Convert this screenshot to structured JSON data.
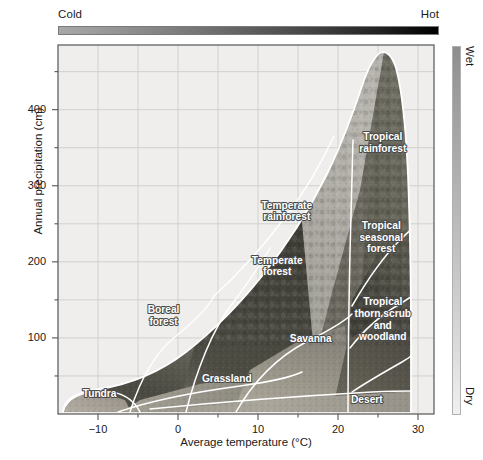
{
  "figure": {
    "axes": {
      "x_title": "Average temperature (°C)",
      "y_title": "Annual precipitation (cm)"
    },
    "gradients": {
      "temperature": {
        "left_label": "Cold",
        "right_label": "Hot",
        "left_color": "#a8a8a8",
        "right_color": "#000000"
      },
      "precipitation": {
        "top_label": "Wet",
        "bottom_label": "Dry",
        "top_color": "#8d8d8d",
        "bottom_color": "#f0f0f0"
      }
    }
  },
  "chart_data": {
    "type": "scatter",
    "title": "",
    "xlabel": "Average temperature (°C)",
    "ylabel": "Annual precipitation (cm)",
    "xlim": [
      -15,
      32
    ],
    "ylim": [
      0,
      485
    ],
    "xticks_major": [
      -10,
      0,
      10,
      20,
      30
    ],
    "xticks_major_labels": [
      "−10",
      "0",
      "10",
      "20",
      "30"
    ],
    "xticks_minor": [
      -5,
      5,
      15,
      25
    ],
    "yticks_major": [
      100,
      200,
      300,
      400
    ],
    "yticks_major_labels": [
      "100",
      "200",
      "300",
      "400"
    ],
    "yticks_minor": [
      50,
      150,
      250,
      350,
      450
    ],
    "grid": true,
    "legend": "none",
    "biomes": [
      {
        "name": "Tundra",
        "label": "Tundra",
        "label_lines": [
          "Tundra"
        ],
        "temp_c": [
          -13.5,
          -4.5
        ],
        "precip_cm": [
          2,
          40
        ],
        "label_at": {
          "x": -9.8,
          "y": 22
        }
      },
      {
        "name": "Boreal forest",
        "label": "Boreal forest",
        "label_lines": [
          "Boreal",
          "forest"
        ],
        "temp_c": [
          -5,
          5
        ],
        "precip_cm": [
          10,
          175
        ],
        "label_at": {
          "x": -1.8,
          "y": 125
        }
      },
      {
        "name": "Temperate rainforest",
        "label": "Temperate rainforest",
        "label_lines": [
          "Temperate",
          "rainforest"
        ],
        "temp_c": [
          5,
          21
        ],
        "precip_cm": [
          200,
          400
        ],
        "label_at": {
          "x": 13.6,
          "y": 262
        }
      },
      {
        "name": "Temperate forest",
        "label": "Temperate forest",
        "label_lines": [
          "Temperate",
          "forest"
        ],
        "temp_c": [
          5,
          21
        ],
        "precip_cm": [
          60,
          240
        ],
        "label_at": {
          "x": 12.4,
          "y": 190
        }
      },
      {
        "name": "Grassland",
        "label": "Grassland",
        "label_lines": [
          "Grassland"
        ],
        "temp_c": [
          0,
          14
        ],
        "precip_cm": [
          10,
          90
        ],
        "label_at": {
          "x": 6.1,
          "y": 42
        }
      },
      {
        "name": "Savanna",
        "label": "Savanna",
        "label_lines": [
          "Savanna"
        ],
        "temp_c": [
          14,
          23
        ],
        "precip_cm": [
          25,
          140
        ],
        "label_at": {
          "x": 16.6,
          "y": 95
        }
      },
      {
        "name": "Desert",
        "label": "Desert",
        "label_lines": [
          "Desert"
        ],
        "temp_c": [
          10,
          31
        ],
        "precip_cm": [
          0,
          40
        ],
        "label_at": {
          "x": 23.6,
          "y": 15
        }
      },
      {
        "name": "Tropical rainforest",
        "label": "Tropical rainforest",
        "label_lines": [
          "Tropical",
          "rainforest"
        ],
        "temp_c": [
          21,
          31
        ],
        "precip_cm": [
          200,
          475
        ],
        "label_at": {
          "x": 25.6,
          "y": 352
        }
      },
      {
        "name": "Tropical seasonal forest",
        "label": "Tropical seasonal forest",
        "label_lines": [
          "Tropical",
          "seasonal",
          "forest"
        ],
        "temp_c": [
          21,
          31
        ],
        "precip_cm": [
          130,
          280
        ],
        "label_at": {
          "x": 25.4,
          "y": 228
        }
      },
      {
        "name": "Tropical thorn scrub and woodland",
        "label": "Tropical thorn scrub and woodland",
        "label_lines": [
          "Tropical",
          "thorn scrub",
          "and",
          "woodland"
        ],
        "temp_c": [
          21,
          31
        ],
        "precip_cm": [
          30,
          150
        ],
        "label_at": {
          "x": 25.6,
          "y": 120
        }
      }
    ]
  }
}
